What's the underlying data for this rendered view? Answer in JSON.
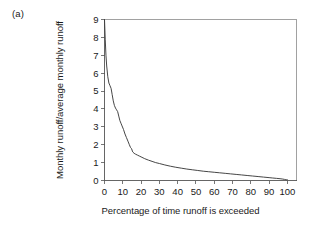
{
  "figure": {
    "panel_label": "(a)",
    "background_color": "#ffffff",
    "line_color": "#3c3c3c",
    "axis_color": "#555555",
    "frame_color": "#8a8a8a"
  },
  "chart_data": {
    "type": "line",
    "title": "",
    "subtitle": "",
    "panel": "(a)",
    "xlabel": "Percentage of time runoff is exceeded",
    "ylabel": "Monthly runoff/average monthly runoff",
    "xlim": [
      0,
      105
    ],
    "ylim": [
      0,
      9
    ],
    "xticks": [
      0,
      10,
      20,
      30,
      40,
      50,
      60,
      70,
      80,
      90,
      100
    ],
    "xtick_labels": [
      "0",
      "10",
      "20",
      "30",
      "40",
      "50",
      "60",
      "70",
      "80",
      "90",
      "100"
    ],
    "yticks": [
      0,
      1,
      2,
      3,
      4,
      5,
      6,
      7,
      8,
      9
    ],
    "ytick_labels": [
      "0",
      "1",
      "2",
      "3",
      "4",
      "5",
      "6",
      "7",
      "8",
      "9"
    ],
    "grid": false,
    "legend": null,
    "legend_position": "none",
    "annotations": [],
    "series": [
      {
        "name": "flow duration curve",
        "x": [
          0,
          0.4,
          0.8,
          1.2,
          1.8,
          2.4,
          3.0,
          3.6,
          4.2,
          4.8,
          5.4,
          6.0,
          6.6,
          7.2,
          7.8,
          8.4,
          9.0,
          9.6,
          10.4,
          11.2,
          12.0,
          12.8,
          13.6,
          14.2,
          14.8,
          15.4,
          16.2,
          17.0,
          18.0,
          19.0,
          20.0,
          22.0,
          24.0,
          26.0,
          28.0,
          30.0,
          33.0,
          36.0,
          39.0,
          42.0,
          45.0,
          48.0,
          51.0,
          54.0,
          57.0,
          60.0,
          63.0,
          66.0,
          69.0,
          72.0,
          75.0,
          78.0,
          81.0,
          84.0,
          87.0,
          90.0,
          92.0,
          94.0,
          96.0,
          97.5,
          98.5,
          99.2,
          99.7,
          100.0
        ],
        "y": [
          9.0,
          7.9,
          7.0,
          6.4,
          5.8,
          5.45,
          5.3,
          5.15,
          4.8,
          4.45,
          4.2,
          4.05,
          3.95,
          3.85,
          3.6,
          3.35,
          3.2,
          3.05,
          2.85,
          2.6,
          2.4,
          2.2,
          2.0,
          1.85,
          1.78,
          1.6,
          1.52,
          1.47,
          1.42,
          1.37,
          1.32,
          1.22,
          1.14,
          1.07,
          1.0,
          0.95,
          0.87,
          0.8,
          0.74,
          0.69,
          0.64,
          0.6,
          0.56,
          0.52,
          0.49,
          0.46,
          0.43,
          0.4,
          0.37,
          0.34,
          0.31,
          0.28,
          0.25,
          0.22,
          0.19,
          0.16,
          0.14,
          0.12,
          0.1,
          0.08,
          0.06,
          0.05,
          0.04,
          0.04
        ]
      }
    ]
  }
}
